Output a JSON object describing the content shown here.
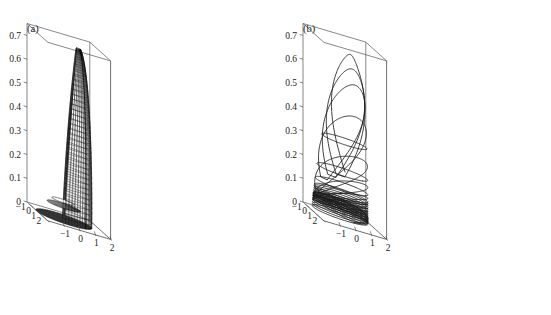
{
  "figure": {
    "background": "#ffffff",
    "ink": "#1a1a1a",
    "panels": [
      {
        "id": "a",
        "label": "(a)",
        "kind": "surface",
        "description": "shaded funnel-shaped invariant-manifold surface with mesh lines and white elliptical hole at the base"
      },
      {
        "id": "b",
        "label": "(b)",
        "kind": "trajectory",
        "description": "chaotic attractor trajectory winding on the manifold, dense loops near z=0 rising to z=0.73"
      }
    ]
  },
  "chart_data": {
    "type": "line",
    "title": "",
    "xlabel": "",
    "ylabel": "",
    "zlabel": "",
    "grid": false,
    "legend": null,
    "projection": "3d-axonometric",
    "axes": {
      "x": {
        "label": "",
        "ticks": [
          -1,
          0,
          1,
          2
        ],
        "tick_labels": [
          "−1",
          "0",
          "1",
          "2"
        ],
        "range": [
          -2,
          2
        ]
      },
      "y": {
        "label": "",
        "ticks": [
          -1,
          0,
          1,
          2
        ],
        "tick_labels": [
          "−1",
          "0",
          "1",
          "2"
        ],
        "range": [
          -2,
          2
        ]
      },
      "z": {
        "label": "",
        "ticks": [
          0,
          0.1,
          0.2,
          0.3,
          0.4,
          0.5,
          0.6,
          0.7
        ],
        "tick_labels": [
          "0",
          "0.1",
          "0.2",
          "0.3",
          "0.4",
          "0.5",
          "0.6",
          "0.7"
        ],
        "range": [
          0,
          0.75
        ]
      }
    },
    "panel_a": {
      "type": "surface",
      "z_top": 0.73,
      "z_bottom": 0.0,
      "mesh_rings": 34,
      "mesh_meridians": 28,
      "hole": {
        "present": true,
        "fill": "#ffffff",
        "center_xy": [
          -0.35,
          -0.1
        ]
      },
      "shading": "grayscale",
      "shade_dark": "#2a2a2a",
      "shade_light": "#8e8e8e"
    },
    "panel_b": {
      "type": "line",
      "loops": 18,
      "z_peak": 0.73,
      "z_dense_band": 0.07,
      "series": [
        {
          "name": "trajectory",
          "color": "#1c1c1c",
          "loop_peaks": [
            0.73,
            0.66,
            0.61,
            0.53,
            0.33,
            0.2,
            0.14,
            0.11,
            0.095,
            0.085,
            0.082,
            0.079,
            0.077,
            0.075,
            0.074,
            0.073,
            0.072,
            0.071
          ]
        }
      ]
    }
  }
}
